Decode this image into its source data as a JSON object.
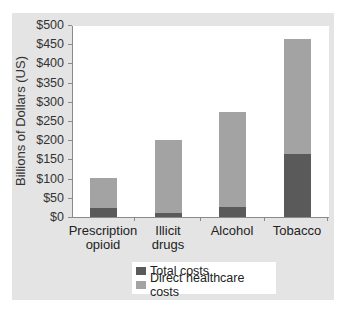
{
  "chart_data": {
    "type": "bar",
    "stacked": true,
    "title": "",
    "xlabel": "",
    "ylabel": "Billions of Dollars (US)",
    "ylim": [
      0,
      500
    ],
    "yticks": [
      "$0",
      "$50",
      "$100",
      "$150",
      "$200",
      "$250",
      "$300",
      "$350",
      "$400",
      "$450",
      "$500"
    ],
    "categories": [
      "Prescription opioid",
      "Illicit drugs",
      "Alcohol",
      "Tobacco"
    ],
    "category_lines": [
      [
        "Prescription",
        "opioid"
      ],
      [
        "Illicit",
        "drugs"
      ],
      [
        "Alcohol"
      ],
      [
        "Tobacco"
      ]
    ],
    "series": [
      {
        "name": "Total costs",
        "color": "#5a5a5a",
        "values": [
          23,
          11,
          26,
          164
        ]
      },
      {
        "name": "Direct healthcare costs",
        "color": "#a3a3a3",
        "values": [
          102,
          200,
          273,
          464
        ]
      }
    ],
    "note": "Light bar height = overall bar top; dark segment overlaid from base",
    "grid": false,
    "legend_position": "bottom-center"
  },
  "colors": {
    "panel_bg": "#e4e4e4",
    "plot_bg": "#ffffff",
    "dark": "#5a5a5a",
    "light": "#a3a3a3"
  }
}
